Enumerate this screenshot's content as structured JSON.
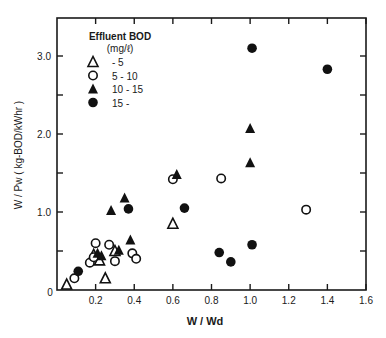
{
  "chart_data": {
    "type": "scatter",
    "title": "",
    "xlabel": "W / Wd",
    "ylabel": "W / Pw ( kg-BOD/kWhr )",
    "xlim": [
      0,
      1.6
    ],
    "ylim": [
      0,
      3.4
    ],
    "x_ticks": [
      0.2,
      0.4,
      0.6,
      0.8,
      1.0,
      1.2,
      1.4,
      1.6
    ],
    "x_tick_labels": [
      "0.2",
      "0.4",
      "0.6",
      "0.8",
      "1.0",
      "1.2",
      "1.4",
      "1.6"
    ],
    "y_ticks": [
      0.5,
      1.0,
      1.5,
      2.0,
      2.5,
      3.0
    ],
    "y_tick_labels": [
      "",
      "1.0",
      "",
      "2.0",
      "",
      "3.0"
    ],
    "origin_label": "0",
    "grid": false,
    "legend": {
      "title": "Effluent BOD",
      "subtitle": "(mg/ℓ)",
      "position": "upper-left"
    },
    "series": [
      {
        "name": "- 5",
        "marker": "open-triangle",
        "points": [
          [
            0.05,
            0.07
          ],
          [
            0.25,
            0.15
          ],
          [
            0.19,
            0.45
          ],
          [
            0.22,
            0.38
          ],
          [
            0.3,
            0.5
          ],
          [
            0.6,
            0.85
          ]
        ]
      },
      {
        "name": "5 - 10",
        "marker": "open-circle",
        "points": [
          [
            0.09,
            0.15
          ],
          [
            0.17,
            0.35
          ],
          [
            0.19,
            0.42
          ],
          [
            0.2,
            0.6
          ],
          [
            0.27,
            0.58
          ],
          [
            0.3,
            0.37
          ],
          [
            0.39,
            0.47
          ],
          [
            0.41,
            0.4
          ],
          [
            0.6,
            1.42
          ],
          [
            0.85,
            1.43
          ],
          [
            1.29,
            1.03
          ]
        ]
      },
      {
        "name": "10 - 15",
        "marker": "filled-triangle",
        "points": [
          [
            0.21,
            0.47
          ],
          [
            0.23,
            0.44
          ],
          [
            0.28,
            1.02
          ],
          [
            0.32,
            0.51
          ],
          [
            0.35,
            1.18
          ],
          [
            0.38,
            0.64
          ],
          [
            0.62,
            1.48
          ],
          [
            1.0,
            2.07
          ],
          [
            1.0,
            1.63
          ]
        ]
      },
      {
        "name": "15 -",
        "marker": "filled-circle",
        "points": [
          [
            0.11,
            0.24
          ],
          [
            0.37,
            1.04
          ],
          [
            0.66,
            1.05
          ],
          [
            0.84,
            0.48
          ],
          [
            0.9,
            0.36
          ],
          [
            1.01,
            0.58
          ],
          [
            1.01,
            3.1
          ],
          [
            1.4,
            2.83
          ]
        ]
      }
    ]
  }
}
